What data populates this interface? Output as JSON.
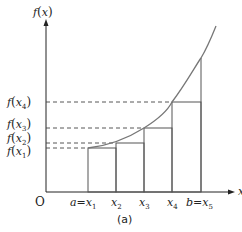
{
  "figure": {
    "caption": "(a)",
    "y_axis_label": {
      "f": "f",
      "open": "(",
      "var": "x",
      "close": ")"
    },
    "x_axis_label": "x",
    "origin_label": "O",
    "colors": {
      "axis": "#222222",
      "curve": "#777777",
      "rect": "#555555",
      "dash": "#444444"
    }
  },
  "x_ticks": [
    {
      "prefix": "a=",
      "var": "x",
      "sub": "1"
    },
    {
      "prefix": "",
      "var": "x",
      "sub": "2"
    },
    {
      "prefix": "",
      "var": "x",
      "sub": "3"
    },
    {
      "prefix": "",
      "var": "x",
      "sub": "4"
    },
    {
      "prefix": "b=",
      "var": "x",
      "sub": "5"
    }
  ],
  "y_ticks": [
    {
      "f": "f",
      "var": "x",
      "sub": "4"
    },
    {
      "f": "f",
      "var": "x",
      "sub": "3"
    },
    {
      "f": "f",
      "var": "x",
      "sub": "2"
    },
    {
      "f": "f",
      "var": "x",
      "sub": "1"
    }
  ]
}
